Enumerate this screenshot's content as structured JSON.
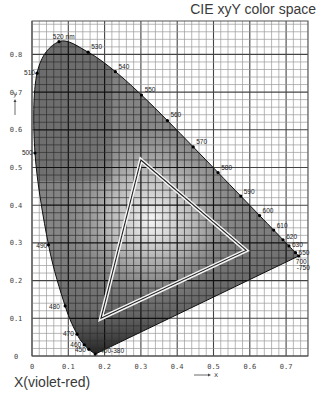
{
  "title": "CIE xyY color space",
  "x_caption": "X(violet-red)",
  "chart_data": {
    "type": "scatter",
    "title": "CIE xyY color space",
    "xlabel": "x",
    "ylabel": "y",
    "xlim": [
      0,
      0.76
    ],
    "ylim": [
      0,
      0.89
    ],
    "grid": true,
    "x_ticks": [
      "0",
      "0.1",
      "0.2",
      "0.3",
      "0.4",
      "0.5",
      "0.6",
      "0.7"
    ],
    "y_ticks": [
      "0",
      "0.1",
      "0.2",
      "0.3",
      "0.4",
      "0.5",
      "0.6",
      "0.7",
      "0.8"
    ],
    "spectral_locus": [
      {
        "nm": "380",
        "x": 0.1741,
        "y": 0.005
      },
      {
        "nm": "450",
        "x": 0.1566,
        "y": 0.0177
      },
      {
        "nm": "460",
        "x": 0.144,
        "y": 0.0297
      },
      {
        "nm": "470",
        "x": 0.1241,
        "y": 0.0578
      },
      {
        "nm": "480",
        "x": 0.0913,
        "y": 0.1327
      },
      {
        "nm": "490",
        "x": 0.0454,
        "y": 0.295
      },
      {
        "nm": "500",
        "x": 0.0082,
        "y": 0.5384
      },
      {
        "nm": "510",
        "x": 0.0139,
        "y": 0.7502
      },
      {
        "nm": "520",
        "x": 0.0743,
        "y": 0.8338
      },
      {
        "nm": "530",
        "x": 0.1547,
        "y": 0.8059
      },
      {
        "nm": "540",
        "x": 0.2296,
        "y": 0.7543
      },
      {
        "nm": "550",
        "x": 0.3016,
        "y": 0.6923
      },
      {
        "nm": "560",
        "x": 0.3731,
        "y": 0.6245
      },
      {
        "nm": "570",
        "x": 0.4441,
        "y": 0.5547
      },
      {
        "nm": "580",
        "x": 0.5125,
        "y": 0.4866
      },
      {
        "nm": "590",
        "x": 0.5752,
        "y": 0.4242
      },
      {
        "nm": "600",
        "x": 0.627,
        "y": 0.3725
      },
      {
        "nm": "610",
        "x": 0.6658,
        "y": 0.334
      },
      {
        "nm": "620",
        "x": 0.6915,
        "y": 0.3083
      },
      {
        "nm": "630",
        "x": 0.7079,
        "y": 0.292
      },
      {
        "nm": "650",
        "x": 0.726,
        "y": 0.274
      },
      {
        "nm": "700-750",
        "x": 0.7347,
        "y": 0.2653
      }
    ],
    "locus_labels": [
      {
        "text": "520 nm",
        "x": 0.074,
        "y": 0.834,
        "dx": -6,
        "dy": -3
      },
      {
        "text": "530",
        "x": 0.155,
        "y": 0.806,
        "dx": 3,
        "dy": -3
      },
      {
        "text": "540",
        "x": 0.23,
        "y": 0.754,
        "dx": 3,
        "dy": -3
      },
      {
        "text": "550",
        "x": 0.302,
        "y": 0.692,
        "dx": 3,
        "dy": -3
      },
      {
        "text": "560",
        "x": 0.373,
        "y": 0.625,
        "dx": 3,
        "dy": -3
      },
      {
        "text": "570",
        "x": 0.444,
        "y": 0.555,
        "dx": 3,
        "dy": -3
      },
      {
        "text": "580",
        "x": 0.513,
        "y": 0.487,
        "dx": 3,
        "dy": -2
      },
      {
        "text": "590",
        "x": 0.575,
        "y": 0.424,
        "dx": 3,
        "dy": -2
      },
      {
        "text": "600",
        "x": 0.627,
        "y": 0.373,
        "dx": 3,
        "dy": -2
      },
      {
        "text": "610",
        "x": 0.666,
        "y": 0.334,
        "dx": 3,
        "dy": -2
      },
      {
        "text": "620",
        "x": 0.692,
        "y": 0.308,
        "dx": 3,
        "dy": -1
      },
      {
        "text": "630",
        "x": 0.708,
        "y": 0.292,
        "dx": 3,
        "dy": 1
      },
      {
        "text": "650",
        "x": 0.726,
        "y": 0.274,
        "dx": 3,
        "dy": 2
      },
      {
        "text": "700",
        "x": 0.735,
        "y": 0.265,
        "dx": -3,
        "dy": 8
      },
      {
        "text": "-750",
        "x": 0.735,
        "y": 0.265,
        "dx": -2,
        "dy": 14
      },
      {
        "text": "510",
        "x": 0.014,
        "y": 0.75,
        "dx": -13,
        "dy": 2
      },
      {
        "text": "500",
        "x": 0.008,
        "y": 0.538,
        "dx": -13,
        "dy": 2
      },
      {
        "text": "490",
        "x": 0.045,
        "y": 0.295,
        "dx": -12,
        "dy": 3
      },
      {
        "text": "480",
        "x": 0.091,
        "y": 0.133,
        "dx": -16,
        "dy": 3
      },
      {
        "text": "470",
        "x": 0.124,
        "y": 0.058,
        "dx": -14,
        "dy": 2
      },
      {
        "text": "460",
        "x": 0.144,
        "y": 0.03,
        "dx": -14,
        "dy": 2
      },
      {
        "text": "450",
        "x": 0.157,
        "y": 0.018,
        "dx": -14,
        "dy": 3
      },
      {
        "text": "400-380",
        "x": 0.174,
        "y": 0.005,
        "dx": 5,
        "dy": -1
      }
    ],
    "gamut_triangle": {
      "vertices": [
        {
          "x": 0.3,
          "y": 0.52
        },
        {
          "x": 0.59,
          "y": 0.28
        },
        {
          "x": 0.19,
          "y": 0.1
        }
      ]
    },
    "x_arrow_label": "x",
    "y_arrow_label": "y"
  }
}
